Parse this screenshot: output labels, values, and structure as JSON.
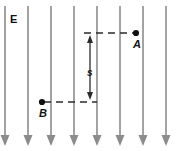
{
  "figure": {
    "type": "physics-diagram",
    "width": 188,
    "height": 151,
    "background_color": "#ffffff"
  },
  "labels": {
    "field": "E",
    "point_a": "A",
    "point_b": "B",
    "separation": "s"
  },
  "colors": {
    "field_line": "#8c8c8c",
    "annotation": "#2b2b2b",
    "point": "#111111",
    "text": "#111111"
  },
  "field": {
    "direction": "downward",
    "line_count": 8,
    "line_x_positions": [
      5,
      28,
      51,
      74,
      97,
      120,
      143,
      166
    ],
    "line_top_y": 6,
    "line_bottom_y": 146,
    "arrow_head_width": 9,
    "arrow_head_length": 11
  },
  "points": [
    {
      "name": "A",
      "x": 136,
      "y": 33,
      "radius": 3.1,
      "label_x": 133,
      "label_y": 48
    },
    {
      "name": "B",
      "x": 42,
      "y": 102,
      "radius": 3.1,
      "label_x": 39,
      "label_y": 117
    }
  ],
  "leaders": [
    {
      "name": "leader-a",
      "x1": 84,
      "y1": 33,
      "x2": 134,
      "y2": 33
    },
    {
      "name": "leader-b",
      "x1": 44,
      "y1": 102,
      "x2": 97,
      "y2": 102
    }
  ],
  "measure": {
    "name": "separation-s",
    "x": 90,
    "top_y": 35,
    "bottom_y": 100,
    "label": "s",
    "label_x": 87,
    "label_y": 76,
    "head_width": 6,
    "head_length": 8
  },
  "field_label": {
    "text": "E",
    "x": 10,
    "y": 23
  }
}
